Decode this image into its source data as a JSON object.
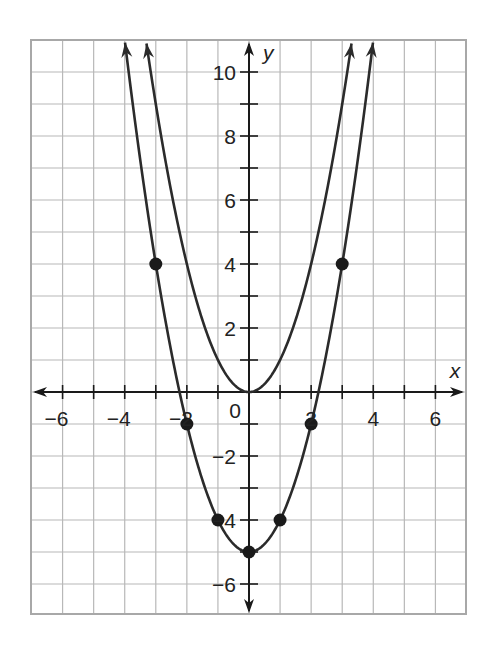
{
  "chart_data": {
    "type": "line",
    "title": "",
    "xlabel": "x",
    "ylabel": "y",
    "xlim": [
      -7,
      7
    ],
    "ylim": [
      -7,
      10.9
    ],
    "grid": true,
    "grid_step": 1,
    "x_ticks": [
      -6,
      -4,
      -2,
      0,
      2,
      4,
      6
    ],
    "y_ticks": [
      -6,
      -4,
      -2,
      2,
      4,
      6,
      8,
      10
    ],
    "origin_label": "0",
    "series": [
      {
        "name": "y = x^2",
        "expression": "x^2",
        "a": 1,
        "k": 0,
        "x_range": [
          -3.3,
          3.3
        ],
        "points": [],
        "arrows": "both ends"
      },
      {
        "name": "y = x^2 - 5",
        "expression": "x^2 - 5",
        "a": 1,
        "k": -5,
        "x_range": [
          -3.99,
          3.99
        ],
        "points": [
          [
            -3,
            4
          ],
          [
            -2,
            -1
          ],
          [
            -1,
            -4
          ],
          [
            0,
            -5
          ],
          [
            1,
            -4
          ],
          [
            2,
            -1
          ],
          [
            3,
            4
          ]
        ],
        "arrows": "both ends"
      }
    ]
  },
  "colors": {
    "grid": "#b8b8b8",
    "frame": "#a8a8a8",
    "axis": "#1a1a1a",
    "curve": "#2b2b2b",
    "point": "#1a1a1a"
  }
}
